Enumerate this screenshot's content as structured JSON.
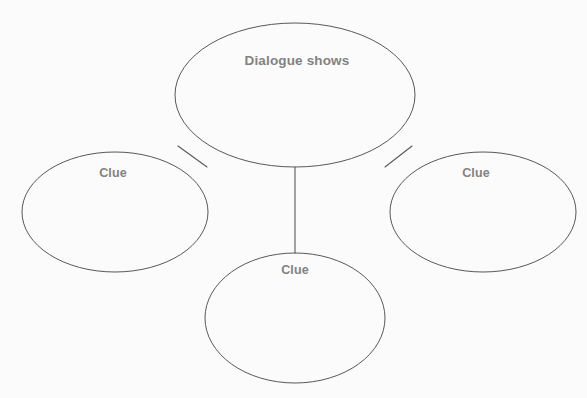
{
  "diagram": {
    "type": "cluster-web-organizer",
    "title": "Dialogue shows",
    "background_color": "#fbfbfb",
    "stroke_color": "#585858",
    "text_color": "#828282",
    "central_node": {
      "label": "Dialogue shows",
      "cx": 295,
      "cy": 95,
      "rx": 120,
      "ry": 72,
      "label_x": 297,
      "label_y": 60
    },
    "branch_nodes": [
      {
        "name": "clue-left",
        "label": "Clue",
        "cx": 115,
        "cy": 212,
        "rx": 93,
        "ry": 60,
        "label_x": 113,
        "label_y": 173
      },
      {
        "name": "clue-right",
        "label": "Clue",
        "cx": 483,
        "cy": 212,
        "rx": 93,
        "ry": 60,
        "label_x": 476,
        "label_y": 173
      },
      {
        "name": "clue-bottom",
        "label": "Clue",
        "cx": 295,
        "cy": 318,
        "rx": 90,
        "ry": 65,
        "label_x": 295,
        "label_y": 270
      }
    ],
    "connectors": [
      {
        "name": "connector-center-to-left",
        "x1": 207,
        "y1": 167,
        "x2": 178,
        "y2": 146
      },
      {
        "name": "connector-center-to-right",
        "x1": 385,
        "y1": 167,
        "x2": 412,
        "y2": 146
      },
      {
        "name": "connector-center-to-bottom",
        "x1": 295,
        "y1": 167,
        "x2": 295,
        "y2": 253
      }
    ]
  }
}
